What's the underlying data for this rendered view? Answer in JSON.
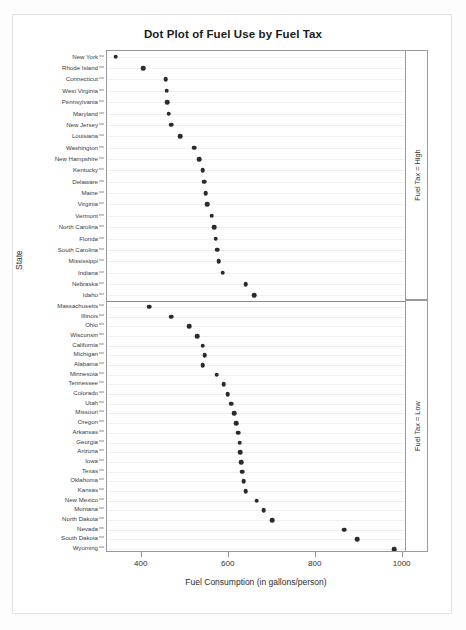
{
  "chart_data": {
    "type": "scatter",
    "title": "Dot Plot of Fuel Use by Fuel Tax",
    "xlabel": "Fuel Consumption (in gallons/person)",
    "ylabel": "State",
    "xlim": [
      320,
      1010
    ],
    "xticks": [
      400,
      600,
      800,
      1000
    ],
    "xticklabels": [
      "400",
      "600",
      "800",
      "1000"
    ],
    "grid": true,
    "legend": "none",
    "panel_variable": "Fuel Tax",
    "panels": [
      {
        "name": "high",
        "strip_label": "Fuel Tax = High",
        "categories": [
          "New York",
          "Rhode Island",
          "Connecticut",
          "West Virginia",
          "Pennsylvania",
          "Maryland",
          "New Jersey",
          "Louisiana",
          "Washington",
          "New Hampshire",
          "Kentucky",
          "Delaware",
          "Maine",
          "Virginia",
          "Vermont",
          "North Carolina",
          "Florida",
          "South Carolina",
          "Mississippi",
          "Indiana",
          "Nebraska",
          "Idaho"
        ],
        "values": [
          340,
          403,
          455,
          457,
          459,
          462,
          468,
          489,
          520,
          532,
          540,
          543,
          547,
          551,
          561,
          566,
          570,
          574,
          577,
          586,
          639,
          659
        ]
      },
      {
        "name": "low",
        "strip_label": "Fuel Tax = Low",
        "categories": [
          "Massachusetts",
          "Illinois",
          "Ohio",
          "Wisconsin",
          "California",
          "Michigan",
          "Alabama",
          "Minnesota",
          "Tennessee",
          "Colorado",
          "Utah",
          "Missouri",
          "Oregon",
          "Arkansas",
          "Georgia",
          "Arizona",
          "Iowa",
          "Texas",
          "Oklahoma",
          "Kansas",
          "New Mexico",
          "Montana",
          "North Dakota",
          "Nevada",
          "South Dakota",
          "Wyoming"
        ],
        "values": [
          417,
          467,
          509,
          528,
          540,
          545,
          540,
          572,
          588,
          598,
          605,
          613,
          617,
          622,
          625,
          627,
          629,
          631,
          634,
          639,
          664,
          680,
          700,
          865,
          895,
          980
        ]
      }
    ]
  },
  "axis": {
    "y_title": "State",
    "x_title": "Fuel Consumption (in gallons/person)"
  },
  "colors": {
    "dot": "#2b2b2b",
    "frame": "#9a9a9a",
    "grid": "#f0f0f0",
    "text": "#2e2e2e"
  }
}
